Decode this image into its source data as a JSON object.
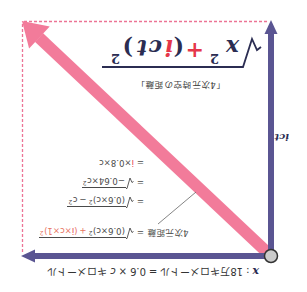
{
  "figure": {
    "rotation_deg": 180,
    "colors": {
      "axis_purple": "#5a5592",
      "hypotenuse_pink": "#f27b9a",
      "dashed_pink": "#ec7395",
      "formula_navy": "#2b2d52",
      "accent_red": "#e5374a",
      "salmon": "#e8735f",
      "origin_fill": "#cbcbcb",
      "origin_stroke": "#333333",
      "leader_gray": "#666666",
      "text_gray": "#4a4a4a"
    },
    "x_axis_label": {
      "variable": "x",
      "separator": ":",
      "distance_text": "18万キロメートル",
      "equals": "=",
      "coefficient": "0.6",
      "times": "×",
      "c": "c",
      "unit": "キロメートル"
    },
    "time_axis_label": "ict",
    "main_formula": {
      "radical": "√",
      "x": "x",
      "x_exp": "2",
      "plus": "+",
      "lparen": "(",
      "i": "i",
      "c": "c",
      "t": "t",
      "rparen": ")",
      "paren_exp": "2"
    },
    "main_caption": "「4次元時空の距離」",
    "calculation": {
      "label": "4次元距離",
      "lines": [
        {
          "eq": "=",
          "term1": "(0.6×c)",
          "term1_exp": "2",
          "op": "+",
          "term2_open": "(",
          "term2_i": "i",
          "term2_rest": "×c×1)",
          "term2_exp": "2"
        },
        {
          "eq": "=",
          "term1": "(0.6×c)",
          "term1_exp": "2",
          "op": "−",
          "term2": "c",
          "term2_exp": "2"
        },
        {
          "eq": "=",
          "term1": "−0.64×c",
          "term1_exp": "2"
        },
        {
          "eq": "=",
          "i": "i",
          "rest": "×0.8×c"
        }
      ]
    }
  }
}
